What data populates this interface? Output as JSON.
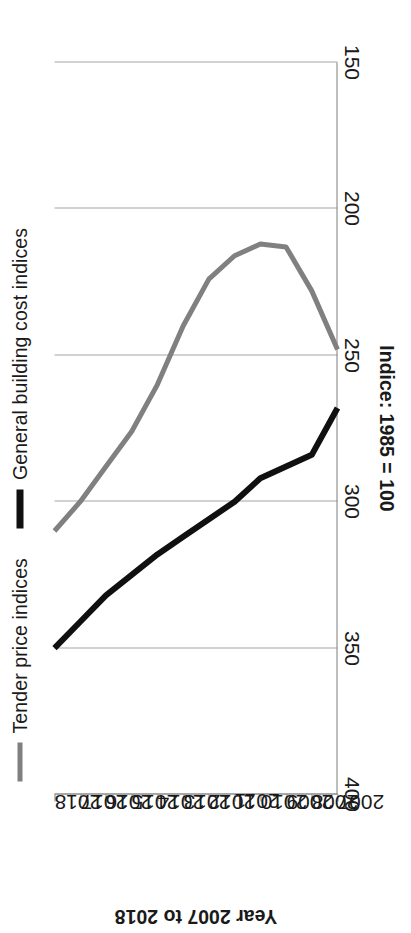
{
  "chart_data": {
    "type": "line",
    "title": "",
    "xlabel": "Year 2007 to 2018",
    "ylabel": "Indice: 1985 = 100",
    "orientation": "rotated-90-ccw",
    "categories": [
      "2007",
      "2008",
      "2009",
      "2010",
      "2011",
      "2012",
      "2013",
      "2014",
      "2015",
      "2016",
      "2017",
      "2018"
    ],
    "x": [
      2007,
      2008,
      2009,
      2010,
      2011,
      2012,
      2013,
      2014,
      2015,
      2016,
      2017,
      2018
    ],
    "xlim": [
      2007,
      2018
    ],
    "ylim": [
      150,
      400
    ],
    "yticks": [
      400,
      350,
      300,
      250,
      200,
      150
    ],
    "ytick_labels": [
      "400",
      "350",
      "300",
      "250",
      "200",
      "150"
    ],
    "grid": true,
    "grid_axis": "y",
    "legend_position": "top",
    "series": [
      {
        "name": "Tender price indices",
        "color": "#808080",
        "width": 5,
        "values": [
          248,
          228,
          213,
          212,
          216,
          224,
          240,
          260,
          276,
          288,
          300,
          310
        ]
      },
      {
        "name": "General building cost indices",
        "color": "#101010",
        "width": 6,
        "values": [
          268,
          284,
          288,
          292,
          300,
          306,
          312,
          318,
          325,
          332,
          341,
          350
        ]
      }
    ]
  },
  "legend": {
    "items": [
      {
        "label": "Tender price indices",
        "marker": "grey"
      },
      {
        "label": "General building cost indices",
        "marker": "black"
      }
    ]
  },
  "axes": {
    "y_title": "Indice: 1985 = 100",
    "x_title": "Year 2007 to 2018"
  }
}
